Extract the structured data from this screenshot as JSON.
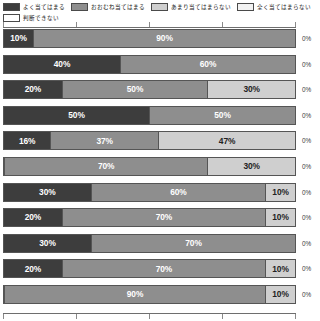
{
  "legend": {
    "items": [
      {
        "label": "よく当てはまる",
        "color": "#3d3d3d"
      },
      {
        "label": "おおむね当てはまる",
        "color": "#8e8e8e"
      },
      {
        "label": "あまり当てはまらない",
        "color": "#cfcfcf"
      },
      {
        "label": "全く当てはまらない",
        "color": "#f2f2f2"
      },
      {
        "label": "判断できない",
        "color": "#ffffff"
      }
    ]
  },
  "axis": {
    "ticks": [
      "0",
      "25",
      "50",
      "75",
      "100"
    ],
    "tick_positions": [
      0,
      25,
      50,
      75,
      100
    ]
  },
  "chart_data": {
    "type": "bar",
    "title": "",
    "xlabel": "",
    "ylabel": "",
    "orientation": "horizontal",
    "stacked": true,
    "normalized": true,
    "xlim": [
      0,
      100
    ],
    "grid": false,
    "legend_position": "top",
    "categories": [
      "項目1",
      "項目2",
      "項目3",
      "項目4",
      "項目5",
      "項目6",
      "項目7",
      "項目8",
      "項目9",
      "項目10",
      "項目11"
    ],
    "series": [
      {
        "name": "よく当てはまる",
        "color": "#3d3d3d",
        "values": [
          10,
          40,
          20,
          50,
          16,
          0,
          30,
          20,
          30,
          20,
          0
        ]
      },
      {
        "name": "おおむね当てはまる",
        "color": "#8e8e8e",
        "values": [
          90,
          60,
          50,
          50,
          37,
          70,
          60,
          70,
          70,
          70,
          90
        ]
      },
      {
        "name": "あまり当てはまらない",
        "color": "#cfcfcf",
        "values": [
          0,
          0,
          30,
          0,
          47,
          30,
          10,
          10,
          0,
          10,
          10
        ]
      },
      {
        "name": "全く当てはまらない",
        "color": "#f2f2f2",
        "values": [
          0,
          0,
          0,
          0,
          0,
          0,
          0,
          0,
          0,
          0,
          0
        ]
      },
      {
        "name": "判断できない",
        "color": "#ffffff",
        "values": [
          0,
          0,
          0,
          0,
          0,
          0,
          0,
          0,
          0,
          0,
          0
        ]
      }
    ],
    "rows": [
      {
        "segments": [
          {
            "value": 10,
            "label": "10%",
            "series": 0
          },
          {
            "value": 90,
            "label": "90%",
            "series": 1
          }
        ],
        "outside_label": "0%"
      },
      {
        "segments": [
          {
            "value": 40,
            "label": "40%",
            "series": 0
          },
          {
            "value": 60,
            "label": "60%",
            "series": 1
          }
        ],
        "outside_label": "0%"
      },
      {
        "segments": [
          {
            "value": 20,
            "label": "20%",
            "series": 0
          },
          {
            "value": 50,
            "label": "50%",
            "series": 1
          },
          {
            "value": 30,
            "label": "30%",
            "series": 2
          }
        ],
        "outside_label": "0%"
      },
      {
        "segments": [
          {
            "value": 50,
            "label": "50%",
            "series": 0
          },
          {
            "value": 50,
            "label": "50%",
            "series": 1
          }
        ],
        "outside_label": "0%"
      },
      {
        "segments": [
          {
            "value": 16,
            "label": "16%",
            "series": 0
          },
          {
            "value": 37,
            "label": "37%",
            "series": 1
          },
          {
            "value": 47,
            "label": "47%",
            "series": 2
          }
        ],
        "outside_label": "0%"
      },
      {
        "segments": [
          {
            "value": 0,
            "label": "0%",
            "series": 0
          },
          {
            "value": 70,
            "label": "70%",
            "series": 1
          },
          {
            "value": 30,
            "label": "30%",
            "series": 2
          }
        ],
        "outside_label": "0%"
      },
      {
        "segments": [
          {
            "value": 30,
            "label": "30%",
            "series": 0
          },
          {
            "value": 60,
            "label": "60%",
            "series": 1
          },
          {
            "value": 10,
            "label": "10%",
            "series": 2
          }
        ],
        "outside_label": "0%"
      },
      {
        "segments": [
          {
            "value": 20,
            "label": "20%",
            "series": 0
          },
          {
            "value": 70,
            "label": "70%",
            "series": 1
          },
          {
            "value": 10,
            "label": "10%",
            "series": 2
          }
        ],
        "outside_label": "0%"
      },
      {
        "segments": [
          {
            "value": 30,
            "label": "30%",
            "series": 0
          },
          {
            "value": 70,
            "label": "70%",
            "series": 1
          }
        ],
        "outside_label": "0%"
      },
      {
        "segments": [
          {
            "value": 20,
            "label": "20%",
            "series": 0
          },
          {
            "value": 70,
            "label": "70%",
            "series": 1
          },
          {
            "value": 10,
            "label": "10%",
            "series": 2
          }
        ],
        "outside_label": "0%"
      },
      {
        "segments": [
          {
            "value": 0,
            "label": "0%",
            "series": 0
          },
          {
            "value": 90,
            "label": "90%",
            "series": 1
          },
          {
            "value": 10,
            "label": "10%",
            "series": 2
          }
        ],
        "outside_label": "0%"
      }
    ]
  }
}
